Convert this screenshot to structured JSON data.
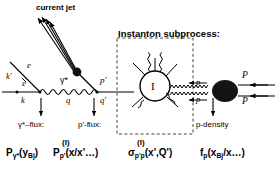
{
  "diagram": {
    "type": "feynman-diagram",
    "colors": {
      "ink": "#000000",
      "background": "#ffffff",
      "blob": "#1a1a1a",
      "dashed_box": "#555555"
    }
  },
  "annotations": {
    "current_jet": "current jet",
    "instanton_subprocess": "Instanton  subprocess:",
    "p_density": "p-density"
  },
  "particle_labels": {
    "electron_in": "e",
    "electron_out": "e",
    "momentum_k": "k",
    "momentum_k_prime": "k'",
    "photon": "γ*",
    "momentum_q": "q",
    "parton_p_prime": "p'",
    "momentum_q_prime": "q'",
    "instanton": "I",
    "gluon_p_upper": "p",
    "gluon_p_lower": "p",
    "proton_P_upper": "P",
    "proton_P_lower": "P"
  },
  "flux_captions": {
    "gamma_flux": "γ*–flux:",
    "p_prime_flux": "p'-flux:"
  },
  "formulas": {
    "gamma_flux": {
      "base": "P",
      "sub": "γ*",
      "arg": "(y",
      "arg_sub": "Bj",
      "arg_end": ")"
    },
    "p_prime_flux": {
      "sup": "(I)",
      "base": "P",
      "sub": "p'",
      "arg": "(x/x'…)"
    },
    "cross_section": {
      "sup": "(I)",
      "base": "σ",
      "sub": "p'p",
      "arg": "(x',Q')"
    },
    "proton_density": {
      "base": "f",
      "sub": "p",
      "arg": "(x",
      "arg_sub": "Bj",
      "arg_end": "/x…)"
    }
  }
}
